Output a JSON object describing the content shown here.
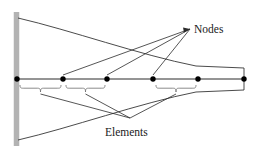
{
  "figure": {
    "type": "finite-element-mesh-diagram",
    "background_color": "#ffffff",
    "line_color": "#2b2b2b",
    "node_color": "#000000",
    "wall_color": "#b3b3b3",
    "brace_color": "#6e6e6e"
  },
  "labels": {
    "nodes": "Nodes",
    "elements": "Elements"
  },
  "support": {
    "name": "fixed-wall",
    "x": 16.5,
    "y_top": 12,
    "y_bottom": 146,
    "width": 5.5,
    "color": "#b3b3b3"
  },
  "axis": {
    "name": "neutral-axis",
    "y": 79,
    "x_start": 17,
    "x_end": 244
  },
  "nodes": [
    {
      "id": 1,
      "x": 17,
      "y": 79
    },
    {
      "id": 2,
      "x": 63,
      "y": 79
    },
    {
      "id": 3,
      "x": 107,
      "y": 79
    },
    {
      "id": 4,
      "x": 153,
      "y": 79
    },
    {
      "id": 5,
      "x": 198,
      "y": 79
    },
    {
      "id": 6,
      "x": 244,
      "y": 79
    }
  ],
  "node_radius": 2.7,
  "envelope": {
    "upper_curve": "M 18,18 C 70,30 140,55 196,66 L 244,68",
    "lower_curve": "M 18,140 C 70,128 140,103 196,92 L 244,90",
    "right_edge": {
      "x": 244,
      "y_top": 68,
      "y_bottom": 90
    }
  },
  "braces": [
    {
      "id": "element-1",
      "x_start": 20,
      "x_end": 61,
      "mid_x": 40.5,
      "y": 85,
      "depth": 7
    },
    {
      "id": "element-2",
      "x_start": 66,
      "x_end": 105,
      "mid_x": 85.5,
      "y": 85,
      "depth": 7
    },
    {
      "id": "element-3",
      "x_start": 156,
      "x_end": 196,
      "mid_x": 176,
      "y": 85,
      "depth": 7
    }
  ],
  "node_leader_lines": {
    "target": {
      "x": 190,
      "y": 29
    },
    "sources": [
      {
        "x": 63,
        "y": 75
      },
      {
        "x": 107,
        "y": 75
      },
      {
        "x": 153,
        "y": 75
      }
    ]
  },
  "element_leader_lines": {
    "target": {
      "x": 130,
      "y": 118
    },
    "sources": [
      {
        "x": 40.5,
        "y": 94
      },
      {
        "x": 85.5,
        "y": 94
      },
      {
        "x": 176,
        "y": 94
      }
    ]
  },
  "label_positions": {
    "nodes": {
      "x": 194,
      "y": 33
    },
    "elements": {
      "x": 105,
      "y": 136
    }
  }
}
